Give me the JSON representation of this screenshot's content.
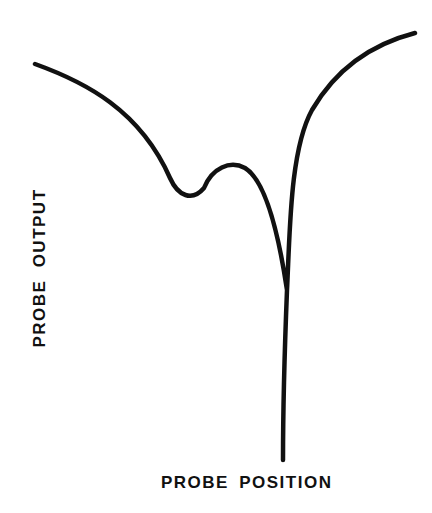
{
  "chart_data": {
    "type": "line",
    "title": "",
    "xlabel": "PROBE POSITION",
    "ylabel": "PROBE OUTPUT",
    "grid": false,
    "legend": null,
    "axes_visible": false,
    "units": "relative (no tick marks; pixel-estimated shape, y increases upward, 0-100 scale)",
    "series": [
      {
        "name": "probe output curve",
        "color": "#111111",
        "x": [
          0,
          10,
          20,
          30,
          35,
          40,
          45,
          50,
          55,
          60,
          65,
          68,
          70,
          72,
          74,
          76,
          78,
          80,
          100
        ],
        "values": [
          80,
          76,
          70,
          61,
          54,
          45,
          46,
          55,
          57,
          54,
          44,
          30,
          0,
          30,
          62,
          74,
          82,
          88,
          92
        ]
      }
    ],
    "features": {
      "local_minimum": {
        "x": 40,
        "y": 45
      },
      "local_maximum": {
        "x": 52,
        "y": 57
      },
      "sharp_minimum": {
        "x": 70,
        "y": 0
      }
    },
    "pixel_path": {
      "stroke_width": 4.5,
      "d": "M35,64 C85,82 140,110 170,178 C178,196 192,202 204,188 C212,168 230,160 245,168 C265,180 278,230 287,290 C290,230 290,150 312,110 C340,62 380,42 415,33 M287,290 C285,340 283,410 283,460"
    }
  }
}
